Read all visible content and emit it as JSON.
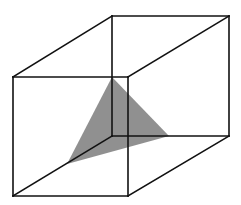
{
  "diagram": {
    "type": "cube-cross-section",
    "colors": {
      "edge": "#111111",
      "section_fill": "#8a8a8a",
      "background": "#ffffff"
    },
    "vertices": {
      "front_top_left": [
        13,
        77
      ],
      "front_top_right": [
        128,
        77
      ],
      "front_bottom_left": [
        13,
        196
      ],
      "front_bottom_right": [
        128,
        196
      ],
      "back_top_left": [
        112,
        16
      ],
      "back_top_right": [
        229,
        16
      ],
      "back_bottom_left": [
        112,
        136
      ],
      "back_bottom_right": [
        229,
        136
      ]
    },
    "section_triangle": [
      [
        112,
        77
      ],
      [
        169,
        136
      ],
      [
        67,
        164
      ]
    ]
  }
}
